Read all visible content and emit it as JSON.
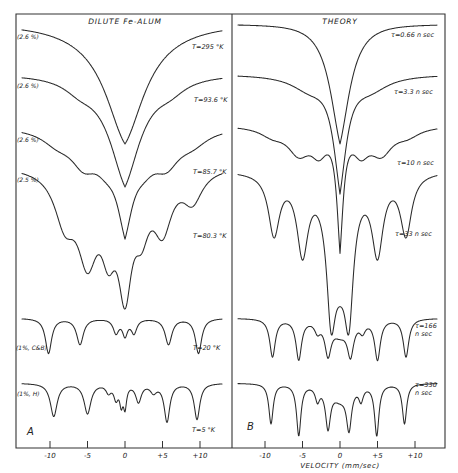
{
  "chart_data": [
    {
      "type": "line",
      "panel": "A",
      "title": "DILUTE Fe-ALUM",
      "xlabel": "",
      "ylabel": "Transmission (offset, arbitrary)",
      "xlim": [
        -13.5,
        13.5
      ],
      "x_ticks": [
        -10,
        -5,
        0,
        5,
        10
      ],
      "x_tick_labels": [
        "-10",
        "-5",
        "0",
        "+5",
        "+10"
      ],
      "grid": false,
      "series": [
        {
          "name": "T=295 °K",
          "sample": "(2.6 %)",
          "baseline_y": 24,
          "lines": [
            {
              "pos": 0,
              "depth": 120,
              "width": 3.2,
              "sharp": 0.35
            }
          ]
        },
        {
          "name": "T=93.6 °K",
          "sample": "(2.6 %)",
          "baseline_y": 74,
          "lines": [
            {
              "pos": 0,
              "depth": 110,
              "width": 2.6,
              "sharp": 0.3
            },
            {
              "pos": -6,
              "depth": 10,
              "width": 2.5
            },
            {
              "pos": 6,
              "depth": 10,
              "width": 2.5
            }
          ]
        },
        {
          "name": "T=85.7 °K",
          "sample": "(2.6 %)",
          "baseline_y": 126,
          "lines": [
            {
              "pos": 0,
              "depth": 86,
              "width": 1.4,
              "sharp": 0.25
            },
            {
              "pos": -5.5,
              "depth": 30,
              "width": 2.2
            },
            {
              "pos": 5.5,
              "depth": 30,
              "width": 2.2
            },
            {
              "pos": -2.5,
              "depth": 22,
              "width": 2.0
            },
            {
              "pos": 2.5,
              "depth": 22,
              "width": 2.0
            },
            {
              "pos": -9,
              "depth": 12,
              "width": 2.5
            },
            {
              "pos": 9,
              "depth": 12,
              "width": 2.5
            }
          ]
        },
        {
          "name": "T=80.3 °K",
          "sample": "(2.5 %)",
          "baseline_y": 165,
          "lines": [
            {
              "pos": 0,
              "depth": 105,
              "width": 1.1
            },
            {
              "pos": -5,
              "depth": 80,
              "width": 1.6
            },
            {
              "pos": 5,
              "depth": 55,
              "width": 1.5
            },
            {
              "pos": -8,
              "depth": 48,
              "width": 1.7
            },
            {
              "pos": 9,
              "depth": 30,
              "width": 1.6
            },
            {
              "pos": -2.2,
              "depth": 60,
              "width": 1.2
            },
            {
              "pos": 2.2,
              "depth": 45,
              "width": 1.2
            }
          ]
        },
        {
          "name": "T=20 °K",
          "sample": "(1%, C&B)",
          "baseline_y": 318,
          "lines": [
            {
              "pos": -10.2,
              "depth": 35,
              "width": 0.5
            },
            {
              "pos": -6,
              "depth": 26,
              "width": 0.55
            },
            {
              "pos": -1.2,
              "depth": 14,
              "width": 0.45
            },
            {
              "pos": 0,
              "depth": 16,
              "width": 0.4
            },
            {
              "pos": 1.2,
              "depth": 14,
              "width": 0.45
            },
            {
              "pos": 5.8,
              "depth": 26,
              "width": 0.55
            },
            {
              "pos": 9.8,
              "depth": 35,
              "width": 0.5
            }
          ]
        },
        {
          "name": "T=5 °K",
          "sample": "(1%, H)",
          "baseline_y": 383,
          "lines": [
            {
              "pos": -9.5,
              "depth": 33,
              "width": 0.55
            },
            {
              "pos": -5,
              "depth": 30,
              "width": 0.55
            },
            {
              "pos": -2.2,
              "depth": 8,
              "width": 0.4
            },
            {
              "pos": -1.2,
              "depth": 14,
              "width": 0.35
            },
            {
              "pos": -0.5,
              "depth": 18,
              "width": 0.25
            },
            {
              "pos": 0,
              "depth": 22,
              "width": 0.25
            },
            {
              "pos": 1.8,
              "depth": 18,
              "width": 0.45
            },
            {
              "pos": 3.8,
              "depth": 8,
              "width": 0.5
            },
            {
              "pos": 5.6,
              "depth": 38,
              "width": 0.45
            },
            {
              "pos": 9.6,
              "depth": 36,
              "width": 0.45
            }
          ]
        }
      ]
    },
    {
      "type": "line",
      "panel": "B",
      "title": "THEORY",
      "xlabel": "VELOCITY (mm/sec)",
      "ylabel": "Transmission (offset, arbitrary)",
      "xlim": [
        -13.5,
        13.5
      ],
      "x_ticks": [
        -10,
        -5,
        0,
        5,
        10
      ],
      "x_tick_labels": [
        "-10",
        "-5",
        "0",
        "+5",
        "+10"
      ],
      "grid": false,
      "series": [
        {
          "name": "τ=0.66 n sec",
          "baseline_y": 24,
          "lines": [
            {
              "pos": 0,
              "depth": 120,
              "width": 1.7,
              "sharp": 0.25
            }
          ]
        },
        {
          "name": "τ=3.3 n sec",
          "baseline_y": 74,
          "lines": [
            {
              "pos": 0,
              "depth": 110,
              "width": 1.2,
              "sharp": 0.2
            },
            {
              "pos": -4,
              "depth": 14,
              "width": 3
            },
            {
              "pos": 4,
              "depth": 14,
              "width": 3
            }
          ]
        },
        {
          "name": "τ=10 n sec",
          "baseline_y": 125,
          "lines": [
            {
              "pos": 0,
              "depth": 115,
              "width": 0.6,
              "sharp": 0.2
            },
            {
              "pos": -5.5,
              "depth": 25,
              "width": 1.8
            },
            {
              "pos": 5.5,
              "depth": 25,
              "width": 1.8
            },
            {
              "pos": -2.8,
              "depth": 22,
              "width": 1.3
            },
            {
              "pos": 2.8,
              "depth": 22,
              "width": 1.3
            },
            {
              "pos": -9,
              "depth": 8,
              "width": 2
            },
            {
              "pos": 9,
              "depth": 8,
              "width": 2
            }
          ]
        },
        {
          "name": "τ=33 n sec",
          "baseline_y": 170,
          "lines": [
            {
              "pos": 0,
              "depth": 80,
              "width": 1.5
            },
            {
              "pos": -1.2,
              "depth": 100,
              "width": 0.7
            },
            {
              "pos": 1.2,
              "depth": 100,
              "width": 0.7
            },
            {
              "pos": -8.8,
              "depth": 60,
              "width": 0.9
            },
            {
              "pos": 8.8,
              "depth": 60,
              "width": 0.9
            },
            {
              "pos": -5,
              "depth": 75,
              "width": 0.9
            },
            {
              "pos": 5,
              "depth": 75,
              "width": 0.9
            }
          ]
        },
        {
          "name": "τ=166 n sec",
          "baseline_y": 318,
          "lines": [
            {
              "pos": -9,
              "depth": 38,
              "width": 0.45
            },
            {
              "pos": -5.5,
              "depth": 40,
              "width": 0.45
            },
            {
              "pos": -3,
              "depth": 10,
              "width": 0.45
            },
            {
              "pos": -1.6,
              "depth": 32,
              "width": 0.5
            },
            {
              "pos": 1.4,
              "depth": 32,
              "width": 0.5
            },
            {
              "pos": 3,
              "depth": 10,
              "width": 0.45
            },
            {
              "pos": 5,
              "depth": 40,
              "width": 0.45
            },
            {
              "pos": 8.8,
              "depth": 38,
              "width": 0.45
            },
            {
              "pos": 0,
              "depth": 14,
              "width": 1.3
            }
          ]
        },
        {
          "name": "τ=330 n sec",
          "baseline_y": 383,
          "lines": [
            {
              "pos": -9.2,
              "depth": 40,
              "width": 0.35
            },
            {
              "pos": -5.5,
              "depth": 51,
              "width": 0.35
            },
            {
              "pos": -3,
              "depth": 14,
              "width": 0.35
            },
            {
              "pos": -1.6,
              "depth": 40,
              "width": 0.4
            },
            {
              "pos": 1.2,
              "depth": 40,
              "width": 0.4
            },
            {
              "pos": 2.8,
              "depth": 14,
              "width": 0.35
            },
            {
              "pos": 4.9,
              "depth": 51,
              "width": 0.35
            },
            {
              "pos": 8.6,
              "depth": 40,
              "width": 0.35
            },
            {
              "pos": 0,
              "depth": 14,
              "width": 1.3
            }
          ]
        }
      ]
    }
  ],
  "panels": {
    "a": {
      "title": "DILUTE Fe-ALUM",
      "letter": "A",
      "labels": [
        {
          "pct": "(2.6 %)",
          "temp": "T=295 °K"
        },
        {
          "pct": "(2.6 %)",
          "temp": "T=93.6 °K"
        },
        {
          "pct": "(2.6 %)",
          "temp": "T=85.7 °K"
        },
        {
          "pct": "(2.5 %)",
          "temp": "T=80.3 °K"
        },
        {
          "pct": "(1%, C&B)",
          "temp": "T=20 °K"
        },
        {
          "pct": "(1%, H)",
          "temp": "T=5 °K"
        }
      ],
      "ticks": [
        "-10",
        "-5",
        "0",
        "+5",
        "+10"
      ]
    },
    "b": {
      "title": "THEORY",
      "letter": "B",
      "labels": [
        {
          "tau": "τ=0.66 n sec"
        },
        {
          "tau": "τ=3.3 n sec"
        },
        {
          "tau": "τ=10 n sec"
        },
        {
          "tau": "τ=33 n sec"
        },
        {
          "tau1": "τ=166",
          "tau2": "n sec"
        },
        {
          "tau1": "τ=330",
          "tau2": "n sec"
        }
      ],
      "ticks": [
        "-10",
        "-5",
        "0",
        "+5",
        "+10"
      ],
      "axis_title": "VELOCITY (mm/sec)"
    }
  }
}
